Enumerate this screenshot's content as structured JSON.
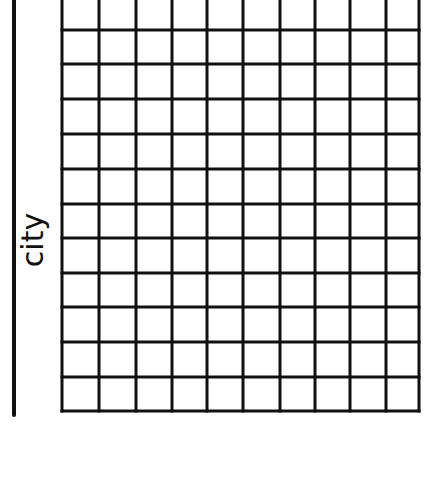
{
  "chart_data": {
    "type": "table",
    "title": "",
    "xlabel": "",
    "ylabel": "city",
    "grid": true,
    "columns": 10,
    "rows_visible": 12,
    "values": [],
    "note_empty": "blank grid — no data plotted",
    "grid_x": [
      62,
      99,
      136,
      172,
      207,
      243,
      280,
      315,
      350,
      386,
      419
    ],
    "grid_y": [
      0,
      30,
      64,
      99,
      134,
      169,
      204,
      238,
      273,
      307,
      342,
      377,
      411
    ],
    "line_color": "#111111",
    "background": "#ffffff"
  },
  "labels": {
    "ylabel": "city"
  }
}
